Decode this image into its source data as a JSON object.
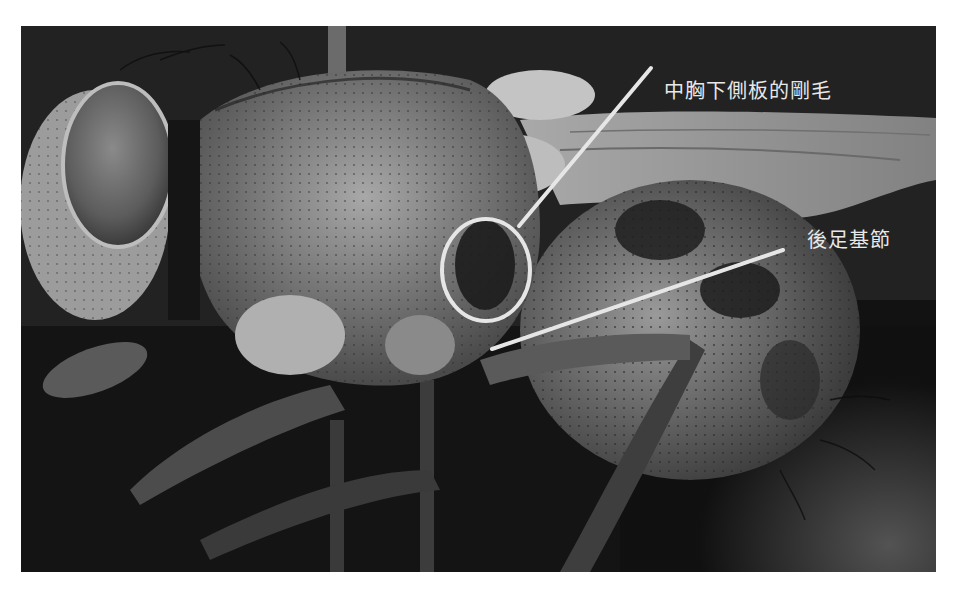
{
  "photo": {
    "subject": "fly (lateral view, macro photograph)",
    "frame": {
      "x": 21,
      "y": 26,
      "width": 915,
      "height": 546
    },
    "background_color": "#1a1a1a",
    "tone": "grayscale"
  },
  "annotations": [
    {
      "id": "mesopleural-bristles",
      "label": "中胸下側板的剛毛",
      "label_position": {
        "x": 664,
        "y": 75
      },
      "line": {
        "x1": 651,
        "y1": 68,
        "x2": 519,
        "y2": 226
      },
      "marker": {
        "type": "ellipse",
        "cx": 486,
        "cy": 270,
        "rx": 44,
        "ry": 51
      }
    },
    {
      "id": "hind-coxa",
      "label": "後足基節",
      "label_position": {
        "x": 807,
        "y": 224
      },
      "line": {
        "x1": 783,
        "y1": 250,
        "x2": 492,
        "y2": 349
      }
    }
  ],
  "annotation_color": "#e6e6e6"
}
